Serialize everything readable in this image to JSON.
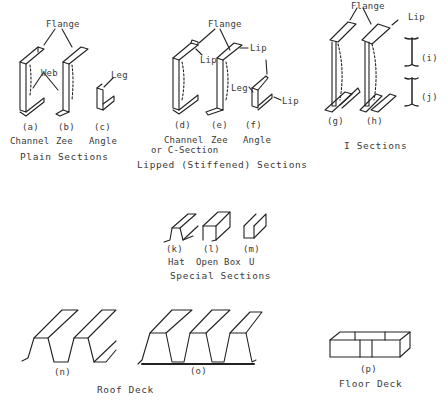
{
  "groups": {
    "plain": {
      "caption": "Plain Sections",
      "callouts": {
        "flange": "Flange",
        "web": "Web",
        "leg": "Leg"
      },
      "items": [
        {
          "letter": "(a)",
          "name": "Channel"
        },
        {
          "letter": "(b)",
          "name": "Zee"
        },
        {
          "letter": "(c)",
          "name": "Angle"
        }
      ]
    },
    "lipped": {
      "caption": "Lipped (Stiffened) Sections",
      "callouts": {
        "flange": "Flange",
        "lip1": "Lip",
        "lip2": "Lip",
        "leg": "Leg",
        "lip3": "Lip"
      },
      "items": [
        {
          "letter": "(d)",
          "name": "Channel",
          "name2": "or C-Section"
        },
        {
          "letter": "(e)",
          "name": "Zee"
        },
        {
          "letter": "(f)",
          "name": "Angle"
        }
      ]
    },
    "i_sections": {
      "caption": "I Sections",
      "callouts": {
        "flange": "Flange",
        "lip": "Lip"
      },
      "items": [
        {
          "letter": "(g)"
        },
        {
          "letter": "(h)"
        },
        {
          "letter": "(i)"
        },
        {
          "letter": "(j)"
        }
      ]
    },
    "special": {
      "caption": "Special Sections",
      "items": [
        {
          "letter": "(k)",
          "name": "Hat"
        },
        {
          "letter": "(l)",
          "name": "Open Box"
        },
        {
          "letter": "(m)",
          "name": "U"
        }
      ]
    },
    "roof_deck": {
      "caption": "Roof Deck",
      "items": [
        {
          "letter": "(n)"
        },
        {
          "letter": "(o)"
        }
      ]
    },
    "floor_deck": {
      "caption": "Floor Deck",
      "items": [
        {
          "letter": "(p)"
        }
      ]
    }
  }
}
